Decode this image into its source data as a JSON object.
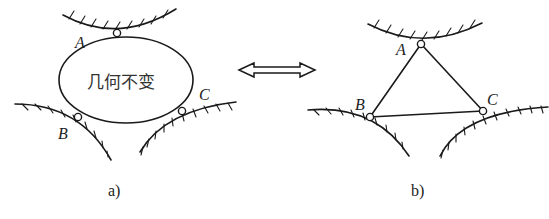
{
  "diagram": {
    "panel_a": {
      "caption": "a)",
      "body_text": "几何不变",
      "nodes": [
        {
          "id": "A",
          "label": "A"
        },
        {
          "id": "B",
          "label": "B"
        },
        {
          "id": "C",
          "label": "C"
        }
      ]
    },
    "equivalence_arrow": "double-headed-arrow",
    "panel_b": {
      "caption": "b)",
      "nodes": [
        {
          "id": "A",
          "label": "A"
        },
        {
          "id": "B",
          "label": "B"
        },
        {
          "id": "C",
          "label": "C"
        }
      ],
      "edges": [
        [
          "A",
          "B"
        ],
        [
          "A",
          "C"
        ],
        [
          "B",
          "C"
        ]
      ]
    },
    "colors": {
      "line": "#1a1a1a",
      "background": "#ffffff"
    }
  }
}
